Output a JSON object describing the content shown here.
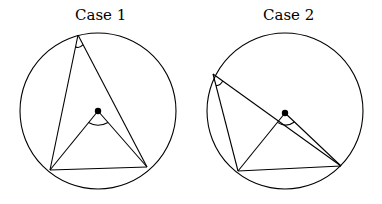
{
  "figure": {
    "panels": [
      {
        "caption": "Case 1",
        "circle": {
          "cx": 98,
          "cy": 111,
          "r": 78
        },
        "center_point": {
          "x": 98,
          "y": 111
        },
        "inscribed_vertex": {
          "x": 78,
          "y": 35
        },
        "chord_endpoints": [
          {
            "x": 50,
            "y": 170
          },
          {
            "x": 147,
            "y": 167
          }
        ],
        "inscribed_angle_marked": true,
        "central_angle_marked": true
      },
      {
        "caption": "Case 2",
        "circle": {
          "cx": 285,
          "cy": 111,
          "r": 78
        },
        "center_point": {
          "x": 285,
          "y": 113
        },
        "inscribed_vertex": {
          "x": 213,
          "y": 74
        },
        "chord_endpoints": [
          {
            "x": 238,
            "y": 171
          },
          {
            "x": 341,
            "y": 166
          }
        ],
        "inscribed_angle_marked": true,
        "central_angle_marked": true
      }
    ],
    "stroke_color": "#000000",
    "background_color": "#ffffff"
  }
}
